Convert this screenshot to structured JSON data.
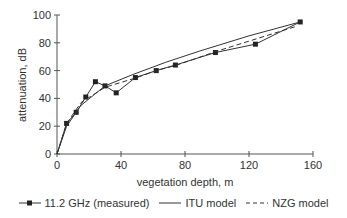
{
  "chart_data": {
    "type": "line",
    "title": "",
    "xlabel": "vegetation depth, m",
    "ylabel": "attenuation, dB",
    "xlim": [
      0,
      160
    ],
    "ylim": [
      0,
      100
    ],
    "xticks": [
      0,
      40,
      80,
      120,
      160
    ],
    "yticks": [
      0,
      20,
      40,
      60,
      80,
      100
    ],
    "grid": false,
    "legend_position": "bottom",
    "series": [
      {
        "name": "11.2 GHz (measured)",
        "style": "solid-with-square-markers",
        "x": [
          0,
          6,
          12,
          18,
          24,
          30,
          37,
          49,
          62,
          74,
          99,
          124,
          152
        ],
        "y": [
          0,
          22,
          30,
          41,
          52,
          49,
          44,
          55,
          60,
          64,
          73,
          79,
          95
        ]
      },
      {
        "name": "ITU model",
        "style": "solid",
        "x": [
          0,
          6,
          15,
          30,
          47,
          68,
          89,
          120,
          152
        ],
        "y": [
          0,
          20,
          35,
          49,
          57,
          66,
          74,
          85,
          95
        ]
      },
      {
        "name": "NZG model",
        "style": "dashed",
        "x": [
          0,
          6,
          15,
          30,
          50,
          62,
          75,
          100,
          125,
          150
        ],
        "y": [
          0,
          22,
          37,
          48,
          55,
          60,
          64,
          74,
          83,
          92
        ]
      }
    ]
  },
  "legend": {
    "measured": "11.2 GHz (measured)",
    "itu": "ITU model",
    "nzg": "NZG model"
  },
  "colors": {
    "axis": "#555555",
    "line": "#333333"
  }
}
